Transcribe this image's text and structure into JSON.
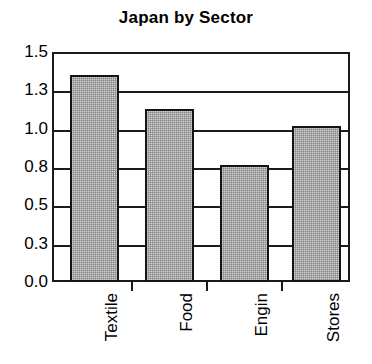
{
  "chart_data": {
    "type": "bar",
    "title": "Japan by Sector",
    "xlabel": "",
    "ylabel": "",
    "categories": [
      "Textile",
      "Food",
      "Engin",
      "Stores"
    ],
    "values": [
      1.35,
      1.13,
      0.76,
      1.02
    ],
    "ylim": [
      0.0,
      1.5
    ],
    "ytick_values": [
      1.5,
      1.3,
      1.0,
      0.8,
      0.5,
      0.3,
      0.0
    ],
    "ytick_labels": [
      "1.5",
      "1.3",
      "1.0",
      "0.8",
      "0.5",
      "0.3",
      "0.0"
    ],
    "grid": true,
    "legend": "none",
    "bar_fill_color": "#d4d4d4",
    "bar_border_color": "#141414",
    "axis_color": "#1a1a1a",
    "label_rotation": -90
  }
}
